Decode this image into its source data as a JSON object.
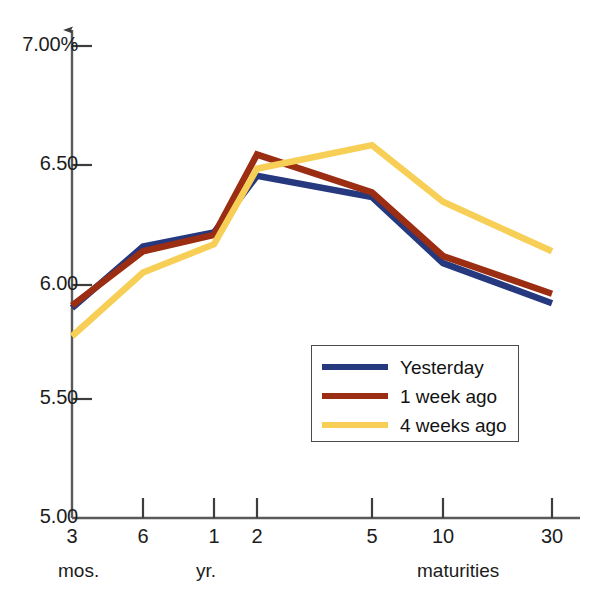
{
  "chart_data": {
    "type": "line",
    "title": "",
    "subtitle": "",
    "xlabel": "maturities",
    "ylabel": "",
    "categories": [
      "3",
      "6",
      "1",
      "2",
      "5",
      "10",
      "30"
    ],
    "category_groups": [
      {
        "label": "mos.",
        "members": [
          "3",
          "6"
        ]
      },
      {
        "label": "yr.",
        "members": [
          "1",
          "2",
          "5",
          "10",
          "30"
        ]
      }
    ],
    "x_positions_px": [
      72,
      143,
      214,
      257,
      372,
      443,
      552
    ],
    "ytick_labels": [
      "7.00%",
      "6.50",
      "6.00",
      "5.50",
      "5.00"
    ],
    "ytick_values": [
      7.0,
      6.5,
      6.0,
      5.5,
      5.0
    ],
    "ylim": [
      5.0,
      7.0
    ],
    "grid": false,
    "legend_position": "inside-lower-right",
    "series": [
      {
        "name": "Yesterday",
        "color": "#26397e",
        "values": [
          5.89,
          6.15,
          6.21,
          6.45,
          6.36,
          6.08,
          5.91
        ]
      },
      {
        "name": "1 week ago",
        "color": "#9b2d12",
        "values": [
          5.9,
          6.13,
          6.2,
          6.54,
          6.38,
          6.11,
          5.95
        ]
      },
      {
        "name": "4 weeks ago",
        "color": "#f7cf56",
        "values": [
          5.77,
          6.04,
          6.16,
          6.48,
          6.58,
          6.34,
          6.13
        ]
      }
    ]
  },
  "axis": {
    "y_labels": [
      {
        "text": "7.00%",
        "value": 7.0
      },
      {
        "text": "6.50",
        "value": 6.5
      },
      {
        "text": "6.00",
        "value": 6.0
      },
      {
        "text": "5.50",
        "value": 5.5
      },
      {
        "text": "5.00",
        "value": 5.0
      }
    ],
    "x_labels": [
      {
        "text": "3"
      },
      {
        "text": "6"
      },
      {
        "text": "1"
      },
      {
        "text": "2"
      },
      {
        "text": "5"
      },
      {
        "text": "10"
      },
      {
        "text": "30"
      }
    ],
    "group_labels": [
      {
        "text": "mos."
      },
      {
        "text": "yr."
      },
      {
        "text": "maturities"
      }
    ],
    "axis_color": "#5a5a5a"
  },
  "legend": {
    "items": [
      {
        "label": "Yesterday",
        "color": "#26397e"
      },
      {
        "label": "1 week ago",
        "color": "#9b2d12"
      },
      {
        "label": "4 weeks ago",
        "color": "#f7cf56"
      }
    ]
  },
  "footer": {
    "ghost_text": ""
  }
}
